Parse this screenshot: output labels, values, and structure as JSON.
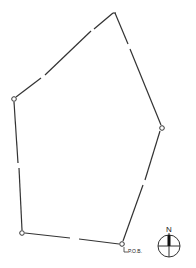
{
  "diagram": {
    "type": "survey-plat",
    "stroke_color": "#333333",
    "background": "#ffffff",
    "vertices": [
      {
        "id": "top",
        "x": 115,
        "y": 13,
        "marker": false
      },
      {
        "id": "right",
        "x": 162,
        "y": 128,
        "marker": true
      },
      {
        "id": "pob",
        "x": 122,
        "y": 244,
        "marker": true
      },
      {
        "id": "bottom-left",
        "x": 22,
        "y": 233,
        "marker": true
      },
      {
        "id": "left",
        "x": 14,
        "y": 99,
        "marker": true
      }
    ],
    "pob_label": "P.O.B.",
    "north_arrow": {
      "label": "N",
      "cx": 169,
      "cy": 246,
      "r": 11
    }
  }
}
